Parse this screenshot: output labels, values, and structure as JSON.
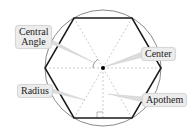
{
  "diagram": {
    "labels": {
      "central_angle": "Central Angle",
      "central_angle_line1": "Central",
      "central_angle_line2": "Angle",
      "center": "Center",
      "radius": "Radius",
      "apothem": "Apothem"
    },
    "colors": {
      "hexagon": "#1a1a1a",
      "circle": "#888888",
      "dashed": "#b0b0b0",
      "label_bg": "#ececec",
      "pointer": "#d8d8d8"
    }
  }
}
